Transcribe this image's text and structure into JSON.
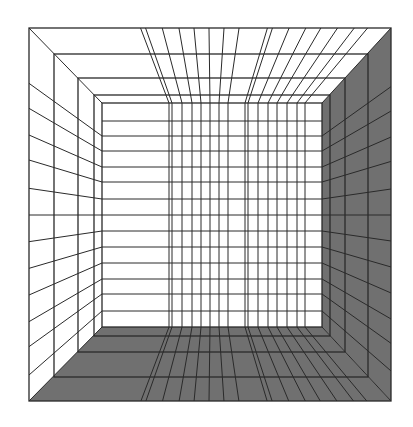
{
  "figure": {
    "title": "Perspective grid room (one-point perspective)",
    "canvas": {
      "width": 413,
      "height": 427
    },
    "colors": {
      "background": "#ffffff",
      "line": "#2a2a2a",
      "shaded_surface": "#707070",
      "light_surface": "#ffffff"
    },
    "vanishing_point": {
      "x": 211.5,
      "y": 215
    },
    "outer_frame": {
      "left": 29,
      "top": 28,
      "right": 391,
      "bottom": 401
    },
    "back_wall": {
      "left": 102,
      "top": 103,
      "right": 322,
      "bottom": 327
    },
    "depth_frames": [
      {
        "left": 54,
        "top": 54,
        "right": 368,
        "bottom": 377
      },
      {
        "left": 78,
        "top": 78,
        "right": 345,
        "bottom": 352
      },
      {
        "left": 94,
        "top": 95,
        "right": 330,
        "bottom": 336
      }
    ],
    "back_wall_rows": [
      121,
      136,
      151,
      167,
      182,
      199,
      215,
      231,
      247,
      263,
      279,
      294,
      311
    ],
    "side_wall_rows": [
      136,
      151,
      167,
      182,
      199,
      215,
      231,
      247,
      263,
      279,
      294,
      311
    ],
    "back_wall_columns": [
      169,
      172,
      182,
      192,
      201,
      210,
      219,
      228,
      245,
      248,
      258,
      268,
      277,
      287,
      297,
      305
    ],
    "surfaces": {
      "left_wall": "light",
      "top_ceiling": "light",
      "back_wall": "light",
      "right_wall": "shaded",
      "floor": "shaded"
    }
  }
}
